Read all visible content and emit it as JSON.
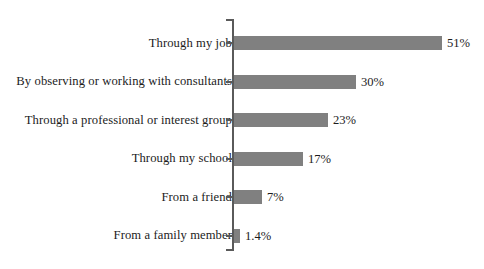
{
  "chart_data": {
    "type": "bar",
    "orientation": "horizontal",
    "title": "",
    "xlabel": "",
    "ylabel": "",
    "xlim": [
      0,
      55
    ],
    "grid": false,
    "legend": false,
    "bar_color": "#808080",
    "axis_color": "#5a5a5a",
    "categories": [
      "Through my job",
      "By observing or working with consultants",
      "Through a professional or interest group",
      "Through my school",
      "From a friend",
      "From a family member"
    ],
    "values": [
      51,
      30,
      23,
      17,
      7,
      1.4
    ],
    "value_labels": [
      "51%",
      "30%",
      "23%",
      "17%",
      "7%",
      "1.4%"
    ]
  },
  "rows": [
    {
      "label": "Through my job",
      "value": 51,
      "value_label": "51%"
    },
    {
      "label": "By observing or working with consultants",
      "value": 30,
      "value_label": "30%"
    },
    {
      "label": "Through a professional or interest group",
      "value": 23,
      "value_label": "23%"
    },
    {
      "label": "Through my school",
      "value": 17,
      "value_label": "17%"
    },
    {
      "label": "From a friend",
      "value": 7,
      "value_label": "7%"
    },
    {
      "label": "From a family member",
      "value": 1.4,
      "value_label": "1.4%"
    }
  ]
}
